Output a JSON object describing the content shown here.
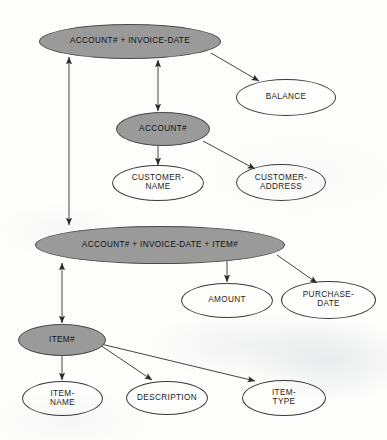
{
  "diagram": {
    "background_color": "#fdfdfc",
    "key_fill_color": "#9a9a9a",
    "stroke_color": "#3a3a3a",
    "nodes": [
      {
        "id": "acct-invdate",
        "label": "ACCOUNT#   +     INVOICE-DATE",
        "type": "key",
        "x": 39,
        "y": 24,
        "w": 182,
        "h": 35,
        "font_size": 8.2
      },
      {
        "id": "balance",
        "label": "BALANCE",
        "type": "attr",
        "x": 236,
        "y": 79,
        "w": 100,
        "h": 37,
        "font_size": 8.2
      },
      {
        "id": "acct",
        "label": "ACCOUNT#",
        "type": "key",
        "x": 116,
        "y": 112,
        "w": 94,
        "h": 34,
        "font_size": 8.2
      },
      {
        "id": "customer-name",
        "label": "CUSTOMER-\nNAME",
        "type": "attr",
        "x": 112,
        "y": 165,
        "w": 92,
        "h": 36,
        "font_size": 8.2
      },
      {
        "id": "customer-address",
        "label": "CUSTOMER-\nADDRESS",
        "type": "attr",
        "x": 236,
        "y": 164,
        "w": 90,
        "h": 37,
        "font_size": 8.2
      },
      {
        "id": "acct-invdate-item",
        "label": "ACCOUNT#    +     INVOICE-DATE     +      ITEM#",
        "type": "key",
        "x": 35,
        "y": 226,
        "w": 250,
        "h": 38,
        "font_size": 8.2
      },
      {
        "id": "amount",
        "label": "AMOUNT",
        "type": "attr",
        "x": 181,
        "y": 283,
        "w": 92,
        "h": 35,
        "font_size": 8.2
      },
      {
        "id": "purchase-date",
        "label": "PURCHASE-\nDATE",
        "type": "attr",
        "x": 281,
        "y": 281,
        "w": 95,
        "h": 38,
        "font_size": 8.2
      },
      {
        "id": "item",
        "label": "ITEM#",
        "type": "key",
        "x": 18,
        "y": 324,
        "w": 88,
        "h": 32,
        "font_size": 8.2
      },
      {
        "id": "item-name",
        "label": "ITEM-\nNAME",
        "type": "attr",
        "x": 22,
        "y": 381,
        "w": 81,
        "h": 35,
        "font_size": 8.2
      },
      {
        "id": "description",
        "label": "DESCRIPTION",
        "type": "attr",
        "x": 126,
        "y": 381,
        "w": 82,
        "h": 34,
        "font_size": 8.2
      },
      {
        "id": "item-type",
        "label": "ITEM-\nTYPE",
        "type": "attr",
        "x": 242,
        "y": 380,
        "w": 84,
        "h": 36,
        "font_size": 8.2
      }
    ],
    "edges": [
      {
        "id": "acct-invdate-to-acct",
        "from": "acct-invdate",
        "to": "acct",
        "style": "double-arrow",
        "x1": 158,
        "y1": 60,
        "x2": 158,
        "y2": 111
      },
      {
        "id": "acct-invdate-to-balance",
        "from": "acct-invdate",
        "to": "balance",
        "style": "arrow",
        "x1": 211,
        "y1": 53,
        "x2": 259,
        "y2": 81
      },
      {
        "id": "acct-invdate-to-composite",
        "from": "acct-invdate",
        "to": "acct-invdate-item",
        "style": "double-arrow",
        "x1": 69,
        "y1": 57,
        "x2": 69,
        "y2": 225
      },
      {
        "id": "acct-to-customer-name",
        "from": "acct",
        "to": "customer-name",
        "style": "arrow",
        "x1": 158,
        "y1": 145,
        "x2": 158,
        "y2": 165
      },
      {
        "id": "acct-to-customer-address",
        "from": "acct",
        "to": "customer-address",
        "style": "arrow",
        "x1": 203,
        "y1": 141,
        "x2": 255,
        "y2": 169
      },
      {
        "id": "composite-to-item",
        "from": "acct-invdate-item",
        "to": "item",
        "style": "double-arrow",
        "x1": 62,
        "y1": 263,
        "x2": 62,
        "y2": 323
      },
      {
        "id": "composite-to-amount",
        "from": "acct-invdate-item",
        "to": "amount",
        "style": "arrow",
        "x1": 227,
        "y1": 260,
        "x2": 227,
        "y2": 282
      },
      {
        "id": "composite-to-purchase-date",
        "from": "acct-invdate-item",
        "to": "purchase-date",
        "style": "arrow",
        "x1": 277,
        "y1": 255,
        "x2": 317,
        "y2": 283
      },
      {
        "id": "item-to-item-name",
        "from": "item",
        "to": "item-name",
        "style": "arrow",
        "x1": 62,
        "y1": 356,
        "x2": 62,
        "y2": 380
      },
      {
        "id": "item-to-description",
        "from": "item",
        "to": "description",
        "style": "arrow",
        "x1": 100,
        "y1": 345,
        "x2": 152,
        "y2": 380
      },
      {
        "id": "item-to-item-type",
        "from": "item",
        "to": "item-type",
        "style": "arrow",
        "x1": 101,
        "y1": 344,
        "x2": 255,
        "y2": 381
      }
    ]
  }
}
